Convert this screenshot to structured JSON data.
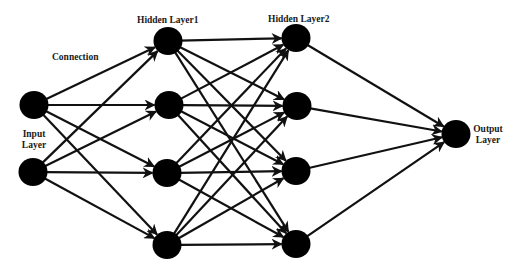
{
  "diagram": {
    "type": "feedforward-neural-network",
    "colors": {
      "background": "#ffffff",
      "node": "#000000",
      "edge": "#111111",
      "text": "#1a1a1a"
    },
    "node_radius": 14,
    "labels": {
      "connection": "Connection",
      "input_layer_line1": "Input",
      "input_layer_line2": "Layer",
      "hidden_layer1": "Hidden Layer1",
      "hidden_layer2": "Hidden Layer2",
      "output_layer_line1": "Output",
      "output_layer_line2": "Layer"
    },
    "layers": [
      {
        "name": "Input Layer",
        "nodes": [
          {
            "x": 34,
            "y": 105
          },
          {
            "x": 33,
            "y": 172
          }
        ]
      },
      {
        "name": "Hidden Layer1",
        "nodes": [
          {
            "x": 168,
            "y": 41
          },
          {
            "x": 169,
            "y": 105
          },
          {
            "x": 167,
            "y": 173
          },
          {
            "x": 167,
            "y": 245
          }
        ]
      },
      {
        "name": "Hidden Layer2",
        "nodes": [
          {
            "x": 296,
            "y": 38
          },
          {
            "x": 297,
            "y": 106
          },
          {
            "x": 296,
            "y": 171
          },
          {
            "x": 296,
            "y": 244
          }
        ]
      },
      {
        "name": "Output Layer",
        "nodes": [
          {
            "x": 456,
            "y": 134
          }
        ]
      }
    ],
    "connectivity": "fully-connected between consecutive layers, directed arrows"
  }
}
